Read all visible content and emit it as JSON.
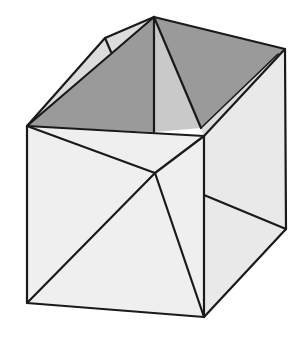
{
  "diagram": {
    "title": "",
    "colors": {
      "stroke": "#1a1a1a",
      "top_dark_faces": "#9a9a9a",
      "top_center_face": "#c9c9c9",
      "side_faces": "#e9e9e9",
      "flap": "#dcdcdc",
      "background": "#ffffff"
    },
    "vertices": {
      "apex": [
        154,
        17
      ],
      "top_right": [
        285,
        49
      ],
      "front_top_left": [
        27,
        126
      ],
      "front_top_right": [
        204,
        136
      ],
      "flap_outer": [
        105,
        38
      ],
      "flap_inner": [
        111,
        52
      ],
      "front_center": [
        155,
        173
      ],
      "right_mid": [
        204,
        195
      ],
      "bottom_left": [
        27,
        303
      ],
      "bottom_right": [
        204,
        317
      ],
      "right_bottom": [
        286,
        229
      ],
      "top_center_base": [
        154,
        132
      ],
      "right_crease_end": [
        201,
        128
      ]
    },
    "labels": []
  }
}
